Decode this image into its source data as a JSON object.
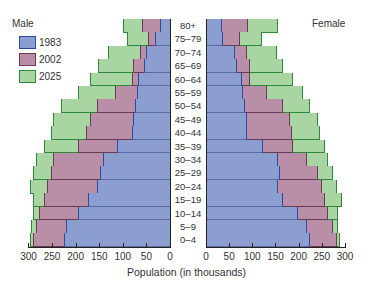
{
  "chart_data": {
    "type": "bar",
    "subtype": "population-pyramid",
    "title": "",
    "xlabel": "Population (in thousands)",
    "ylabel": "",
    "left_label": "Male",
    "right_label": "Female",
    "categories": [
      "80+",
      "75–79",
      "70–74",
      "65–69",
      "60–64",
      "55–59",
      "50–54",
      "45–49",
      "40–44",
      "35–39",
      "30–34",
      "25–29",
      "20–24",
      "15–19",
      "10–14",
      "5–9",
      "0–4"
    ],
    "legend": [
      "1983",
      "2002",
      "2025"
    ],
    "x_ticks_left": [
      "300",
      "250",
      "200",
      "150",
      "100",
      "50",
      "0"
    ],
    "x_ticks_right": [
      "0",
      "50",
      "100",
      "150",
      "200",
      "250",
      "300"
    ],
    "xlim": [
      0,
      300
    ],
    "grid": false,
    "legend_position": "upper-left",
    "colors": {
      "1983": "#8c9ed0",
      "2002": "#b88fa6",
      "2025": "#a9d5a2"
    },
    "male": {
      "1983": [
        21,
        32,
        51,
        55,
        67,
        70,
        74,
        78,
        80,
        112,
        143,
        148,
        154,
        173,
        196,
        221,
        225
      ],
      "2002": [
        59,
        46,
        63,
        78,
        80,
        116,
        154,
        169,
        179,
        196,
        247,
        253,
        260,
        268,
        278,
        285,
        291
      ],
      "2025": [
        99,
        91,
        131,
        152,
        169,
        196,
        232,
        249,
        253,
        268,
        285,
        291,
        297,
        291,
        291,
        295,
        297
      ]
    },
    "female": {
      "1983": [
        35,
        37,
        63,
        67,
        78,
        80,
        84,
        88,
        88,
        123,
        156,
        160,
        156,
        166,
        199,
        218,
        225
      ],
      "2002": [
        91,
        73,
        89,
        95,
        95,
        132,
        166,
        181,
        185,
        188,
        218,
        242,
        250,
        257,
        263,
        274,
        283
      ],
      "2025": [
        156,
        121,
        153,
        166,
        188,
        209,
        225,
        242,
        246,
        257,
        263,
        274,
        283,
        294,
        285,
        285,
        289
      ]
    }
  },
  "labels": {
    "male": "Male",
    "female": "Female",
    "xlabel": "Population (in thousands)",
    "legend": [
      "1983",
      "2002",
      "2025"
    ]
  }
}
